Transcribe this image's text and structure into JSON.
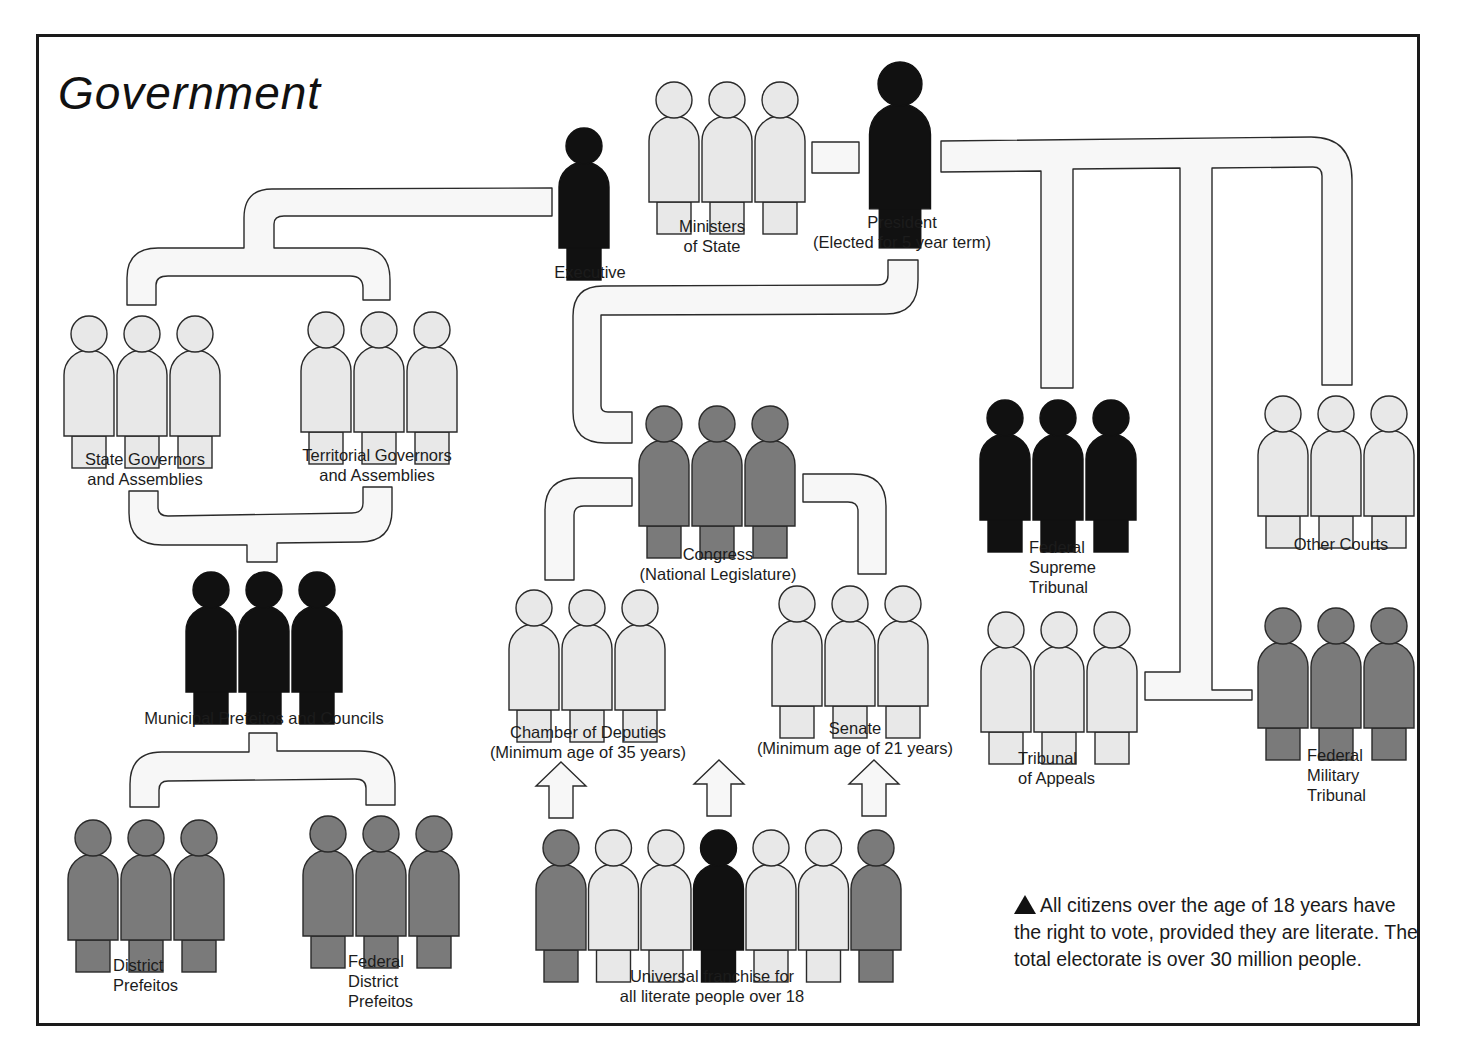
{
  "title": "Government",
  "colors": {
    "black": "#111111",
    "dark": "#7a7a7a",
    "light": "#e8e8e8",
    "pipe": "#f7f7f7",
    "stroke": "#2a2a2a"
  },
  "groups": [
    {
      "id": "executive",
      "lines": [
        "Executive"
      ],
      "fill": "black",
      "x": 584,
      "y": 128,
      "count": 1,
      "label_x": 590,
      "label_y": 262
    },
    {
      "id": "ministers",
      "lines": [
        "Ministers",
        "of State"
      ],
      "fill": "light",
      "x": 674,
      "y": 82,
      "count": 3,
      "label_x": 712,
      "label_y": 216
    },
    {
      "id": "president",
      "lines": [
        "President",
        "(Elected for 5 year term)"
      ],
      "fill": "black",
      "x": 900,
      "y": 62,
      "count": 1,
      "big": true,
      "label_x": 902,
      "label_y": 212
    },
    {
      "id": "state-governors",
      "lines": [
        "State Governors",
        "and Assemblies"
      ],
      "fill": "light",
      "x": 89,
      "y": 316,
      "count": 3,
      "label_x": 145,
      "label_y": 449
    },
    {
      "id": "territorial-governors",
      "lines": [
        "Territorial Governors",
        "and Assemblies"
      ],
      "fill": "light",
      "x": 326,
      "y": 312,
      "count": 3,
      "label_x": 377,
      "label_y": 445
    },
    {
      "id": "municipal",
      "lines": [
        "Municipal Prefeitos and Councils"
      ],
      "fill": "black",
      "x": 211,
      "y": 572,
      "count": 3,
      "label_x": 264,
      "label_y": 708
    },
    {
      "id": "district",
      "lines": [
        "District",
        "Prefeitos"
      ],
      "fill": "dark",
      "x": 93,
      "y": 820,
      "count": 3,
      "label_x": 113,
      "label_y": 955,
      "left": true
    },
    {
      "id": "federal-district",
      "lines": [
        "Federal",
        "District",
        "Prefeitos"
      ],
      "fill": "dark",
      "x": 328,
      "y": 816,
      "count": 3,
      "label_x": 348,
      "label_y": 951,
      "left": true
    },
    {
      "id": "congress",
      "lines": [
        "Congress",
        "(National Legislature)"
      ],
      "fill": "dark",
      "x": 664,
      "y": 406,
      "count": 3,
      "label_x": 718,
      "label_y": 544
    },
    {
      "id": "chamber",
      "lines": [
        "Chamber of Deputies",
        "(Minimum age of 35 years)"
      ],
      "fill": "light",
      "x": 534,
      "y": 590,
      "count": 3,
      "label_x": 588,
      "label_y": 722
    },
    {
      "id": "senate",
      "lines": [
        "Senate",
        "(Minimum age of 21 years)"
      ],
      "fill": "light",
      "x": 797,
      "y": 586,
      "count": 3,
      "label_x": 855,
      "label_y": 718
    },
    {
      "id": "federal-supreme",
      "lines": [
        "Federal",
        "Supreme",
        "Tribunal"
      ],
      "fill": "black",
      "x": 1005,
      "y": 400,
      "count": 3,
      "label_x": 1029,
      "label_y": 537,
      "left": true
    },
    {
      "id": "other-courts",
      "lines": [
        "Other Courts"
      ],
      "fill": "light",
      "x": 1283,
      "y": 396,
      "count": 3,
      "label_x": 1341,
      "label_y": 534
    },
    {
      "id": "tribunal-appeals",
      "lines": [
        "Tribunal",
        "of Appeals"
      ],
      "fill": "light",
      "x": 1006,
      "y": 612,
      "count": 3,
      "label_x": 1018,
      "label_y": 748,
      "left": true
    },
    {
      "id": "federal-military",
      "lines": [
        "Federal",
        "Military",
        "Tribunal"
      ],
      "fill": "dark",
      "x": 1283,
      "y": 608,
      "count": 3,
      "label_x": 1307,
      "label_y": 745,
      "left": true
    }
  ],
  "electorate": {
    "lines": [
      "Universal franchise for",
      "all literate people over 18"
    ],
    "fills": [
      "dark",
      "light",
      "light",
      "black",
      "light",
      "light",
      "dark"
    ],
    "x": 561,
    "y": 830,
    "label_x": 712,
    "label_y": 966
  },
  "arrows": [
    {
      "x": 561,
      "y": 762
    },
    {
      "x": 719,
      "y": 760
    },
    {
      "x": 874,
      "y": 760
    }
  ],
  "note": {
    "symbol": "triangle-up",
    "text": "All citizens over the age of 18 years have the right to vote, provided they are literate. The total electorate is over 30 million people."
  }
}
